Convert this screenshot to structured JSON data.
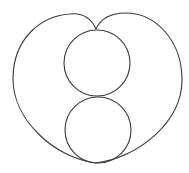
{
  "figure": {
    "width": 189,
    "height": 173,
    "background": "#ffffff",
    "stroke_color": "#3a3a3a",
    "outer_curve": {
      "cusp": [
        96,
        29
      ],
      "left_lobe_top": [
        70,
        14
      ],
      "right_lobe_top": [
        126,
        13
      ],
      "left_extreme": [
        13,
        77
      ],
      "right_extreme": [
        182,
        80
      ],
      "bottom": [
        96,
        163
      ]
    },
    "circles": [
      {
        "name": "upper-circle",
        "cx": 97,
        "cy": 63,
        "r": 33
      },
      {
        "name": "lower-circle",
        "cx": 98,
        "cy": 130,
        "r": 33
      }
    ]
  }
}
